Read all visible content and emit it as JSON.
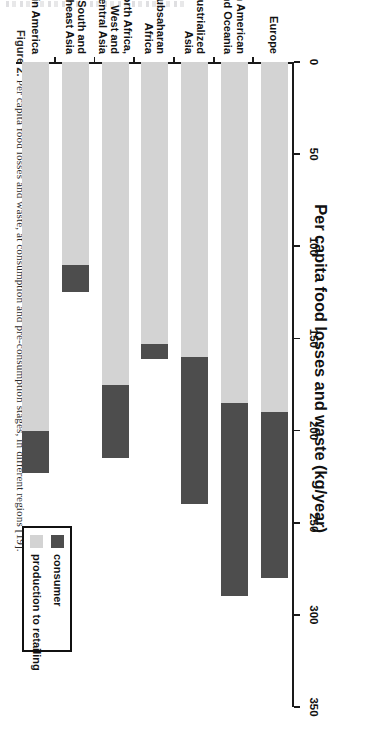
{
  "caption": {
    "label": "Figure 2.",
    "text": " Per capita food losses and waste, at consumption and pre-consumption stages, in different regions [19]."
  },
  "chart_data": {
    "type": "bar",
    "orientation": "horizontal-stacked",
    "title": "Per capita food losses and waste (kg/year)",
    "xlabel": "Per capita food losses and waste (kg/year)",
    "ylabel": "",
    "xlim": [
      0,
      350
    ],
    "xticks": [
      0,
      50,
      100,
      150,
      200,
      250,
      300,
      350
    ],
    "xticklabels": [
      "0",
      "50",
      "100",
      "150",
      "200",
      "250",
      "300",
      "350"
    ],
    "grid": false,
    "legend_position": "inside-lower-right",
    "categories": [
      "Europe",
      "North American and Oceania",
      "Industrialized Asia",
      "Subsaharan Africa",
      "North Africa, West and Central Asia",
      "South and Southeast Asia",
      "Latin America"
    ],
    "category_lines": [
      [
        "Europe"
      ],
      [
        "North American",
        "and Oceania"
      ],
      [
        "Industrialized",
        "Asia"
      ],
      [
        "Subsaharan",
        "Africa"
      ],
      [
        "North Africa,",
        "West and",
        "Central Asia"
      ],
      [
        "South and",
        "Southeast Asia"
      ],
      [
        "Latin America"
      ]
    ],
    "series": [
      {
        "name": "production to retailing",
        "color": "#d3d3d3",
        "values": [
          190,
          185,
          160,
          153,
          175,
          110,
          200
        ]
      },
      {
        "name": "consumer",
        "color": "#4d4d4d",
        "values": [
          90,
          105,
          80,
          8,
          40,
          15,
          23
        ]
      }
    ],
    "totals": [
      280,
      290,
      240,
      161,
      215,
      125,
      223
    ],
    "legend": [
      {
        "label": "consumer",
        "color": "#4d4d4d",
        "swatch": "dark"
      },
      {
        "label": "production to retailing",
        "color": "#d3d3d3",
        "swatch": "light"
      }
    ]
  }
}
